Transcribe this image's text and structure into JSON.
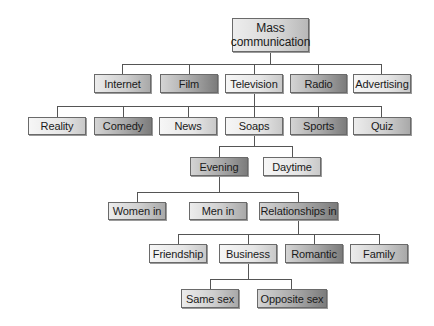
{
  "diagram": {
    "type": "hierarchy-tree",
    "root": "Mass communication",
    "nodes": {
      "mass_communication": "Mass communication",
      "internet": "Internet",
      "film": "Film",
      "television": "Television",
      "radio": "Radio",
      "advertising": "Advertising",
      "reality": "Reality",
      "comedy": "Comedy",
      "news": "News",
      "soaps": "Soaps",
      "sports": "Sports",
      "quiz": "Quiz",
      "evening": "Evening",
      "daytime": "Daytime",
      "women_in": "Women in",
      "men_in": "Men in",
      "relationships_in": "Relationships in",
      "friendship": "Friendship",
      "business": "Business",
      "romantic": "Romantic",
      "family": "Family",
      "same_sex": "Same sex",
      "opposite_sex": "Opposite sex"
    },
    "edges": [
      [
        "Mass communication",
        "Internet"
      ],
      [
        "Mass communication",
        "Film"
      ],
      [
        "Mass communication",
        "Television"
      ],
      [
        "Mass communication",
        "Radio"
      ],
      [
        "Mass communication",
        "Advertising"
      ],
      [
        "Television",
        "Reality"
      ],
      [
        "Television",
        "Comedy"
      ],
      [
        "Television",
        "News"
      ],
      [
        "Television",
        "Soaps"
      ],
      [
        "Television",
        "Sports"
      ],
      [
        "Television",
        "Quiz"
      ],
      [
        "Soaps",
        "Evening"
      ],
      [
        "Soaps",
        "Daytime"
      ],
      [
        "Evening",
        "Women in"
      ],
      [
        "Evening",
        "Men in"
      ],
      [
        "Evening",
        "Relationships in"
      ],
      [
        "Relationships in",
        "Friendship"
      ],
      [
        "Relationships in",
        "Business"
      ],
      [
        "Relationships in",
        "Romantic"
      ],
      [
        "Relationships in",
        "Family"
      ],
      [
        "Business",
        "Same sex"
      ],
      [
        "Business",
        "Opposite sex"
      ]
    ]
  },
  "colors": {
    "line": "#555555",
    "border": "#6a6a6a",
    "background": "#ffffff"
  }
}
